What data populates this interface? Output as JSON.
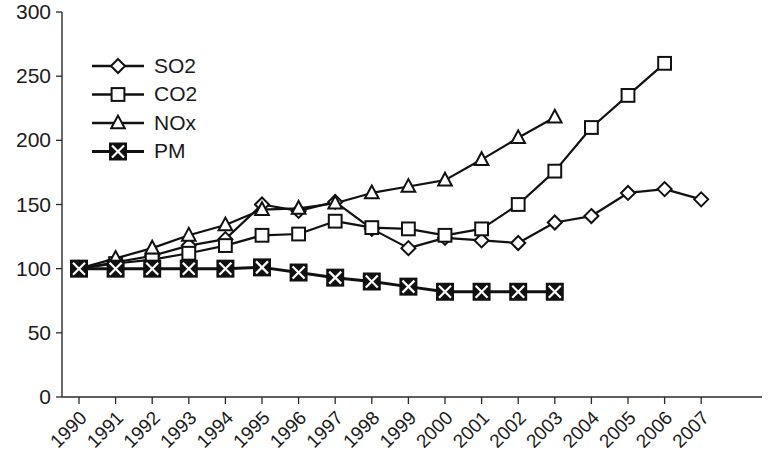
{
  "chart_data": {
    "type": "line",
    "title": "",
    "subtitle": "",
    "xlabel": "",
    "ylabel": "",
    "xlim": [
      1990,
      2007
    ],
    "ylim": [
      0,
      300
    ],
    "grid": false,
    "legend_position": "upper-left",
    "x": [
      1990,
      1991,
      1992,
      1993,
      1994,
      1995,
      1996,
      1997,
      1998,
      1999,
      2000,
      2001,
      2002,
      2003,
      2004,
      2005,
      2006,
      2007
    ],
    "x_tick_labels": [
      "1990",
      "1991",
      "1992",
      "1993",
      "1994",
      "1995",
      "1996",
      "1997",
      "1998",
      "1999",
      "2000",
      "2001",
      "2002",
      "2003",
      "2004",
      "2005",
      "2006",
      "2007"
    ],
    "y_tick_labels": [
      "0",
      "50",
      "100",
      "150",
      "200",
      "250",
      "300"
    ],
    "y_ticks": [
      0,
      50,
      100,
      150,
      200,
      250,
      300
    ],
    "series": [
      {
        "name": "SO2",
        "marker": "diamond-open",
        "x": [
          1990,
          1991,
          1992,
          1993,
          1994,
          1995,
          1996,
          1997,
          1998,
          1999,
          2000,
          2001,
          2002,
          2003,
          2004,
          2005,
          2006,
          2007
        ],
        "values": [
          100,
          105,
          110,
          118,
          123,
          150,
          145,
          152,
          131,
          116,
          124,
          122,
          120,
          136,
          141,
          159,
          162,
          154
        ]
      },
      {
        "name": "CO2",
        "marker": "square-open",
        "x": [
          1990,
          1991,
          1992,
          1993,
          1994,
          1995,
          1996,
          1997,
          1998,
          1999,
          2000,
          2001,
          2002,
          2003,
          2004,
          2005,
          2006
        ],
        "values": [
          100,
          104,
          107,
          112,
          118,
          126,
          127,
          137,
          132,
          131,
          126,
          131,
          150,
          176,
          210,
          235,
          260
        ]
      },
      {
        "name": "NOx",
        "marker": "triangle-open",
        "x": [
          1990,
          1991,
          1992,
          1993,
          1994,
          1995,
          1996,
          1997,
          1998,
          1999,
          2000,
          2001,
          2002,
          2003
        ],
        "values": [
          100,
          108,
          116,
          126,
          134,
          146,
          147,
          151,
          159,
          164,
          169,
          185,
          202,
          218
        ]
      },
      {
        "name": "PM",
        "marker": "x-square-solid",
        "x": [
          1990,
          1991,
          1992,
          1993,
          1994,
          1995,
          1996,
          1997,
          1998,
          1999,
          2000,
          2001,
          2002,
          2003
        ],
        "values": [
          100,
          100,
          100,
          100,
          100,
          101,
          97,
          93,
          90,
          86,
          82,
          82,
          82,
          82
        ]
      }
    ]
  },
  "legend": {
    "items": [
      {
        "label": "SO2",
        "marker": "diamond-open"
      },
      {
        "label": "CO2",
        "marker": "square-open"
      },
      {
        "label": "NOx",
        "marker": "triangle-open"
      },
      {
        "label": "PM",
        "marker": "x-square-solid"
      }
    ]
  },
  "colors": {
    "ink": "#111111",
    "axis": "#2a2a2a",
    "background": "#ffffff",
    "marker_fill": "#ffffff",
    "pm_marker_fill": "#111111"
  }
}
